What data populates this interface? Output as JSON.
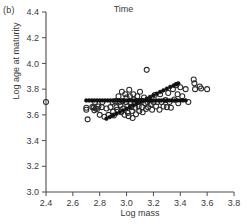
{
  "panel": {
    "label": "(b)"
  },
  "chart_data": {
    "type": "scatter",
    "title": "Time",
    "xlabel": "Log mass",
    "ylabel": "Log age at maturity",
    "xlim": [
      2.4,
      3.8
    ],
    "ylim": [
      3.0,
      4.4
    ],
    "xticks": [
      "2.4",
      "2.6",
      "2.8",
      "3.0",
      "3.2",
      "3.4",
      "3.6",
      "3.8"
    ],
    "yticks": [
      "3.0",
      "3.2",
      "3.4",
      "3.6",
      "3.8",
      "4.0",
      "4.2",
      "4.4"
    ],
    "grid": false,
    "legend": "none",
    "series": [
      {
        "name": "observed",
        "marker": "open-circle",
        "color": "#2b2b2b",
        "points": [
          [
            2.4,
            3.7
          ],
          [
            2.7,
            3.655
          ],
          [
            2.7,
            3.64
          ],
          [
            2.71,
            3.565
          ],
          [
            2.745,
            3.66
          ],
          [
            2.755,
            3.655
          ],
          [
            2.76,
            3.635
          ],
          [
            2.765,
            3.7
          ],
          [
            2.77,
            3.65
          ],
          [
            2.78,
            3.645
          ],
          [
            2.79,
            3.665
          ],
          [
            2.8,
            3.6
          ],
          [
            2.815,
            3.66
          ],
          [
            2.82,
            3.7
          ],
          [
            2.835,
            3.585
          ],
          [
            2.85,
            3.65
          ],
          [
            2.865,
            3.6
          ],
          [
            2.88,
            3.66
          ],
          [
            2.895,
            3.7
          ],
          [
            2.9,
            3.625
          ],
          [
            2.905,
            3.595
          ],
          [
            2.915,
            3.705
          ],
          [
            2.925,
            3.66
          ],
          [
            2.93,
            3.64
          ],
          [
            2.94,
            3.745
          ],
          [
            2.95,
            3.7
          ],
          [
            2.955,
            3.675
          ],
          [
            2.96,
            3.62
          ],
          [
            2.965,
            3.78
          ],
          [
            2.97,
            3.705
          ],
          [
            2.975,
            3.65
          ],
          [
            2.985,
            3.6
          ],
          [
            2.99,
            3.76
          ],
          [
            2.995,
            3.7
          ],
          [
            3.0,
            3.735
          ],
          [
            3.005,
            3.665
          ],
          [
            3.01,
            3.615
          ],
          [
            3.015,
            3.59
          ],
          [
            3.02,
            3.795
          ],
          [
            3.025,
            3.745
          ],
          [
            3.03,
            3.7
          ],
          [
            3.035,
            3.66
          ],
          [
            3.04,
            3.63
          ],
          [
            3.045,
            3.575
          ],
          [
            3.05,
            3.76
          ],
          [
            3.055,
            3.72
          ],
          [
            3.06,
            3.69
          ],
          [
            3.065,
            3.655
          ],
          [
            3.07,
            3.605
          ],
          [
            3.08,
            3.745
          ],
          [
            3.085,
            3.7
          ],
          [
            3.09,
            3.665
          ],
          [
            3.095,
            3.63
          ],
          [
            3.1,
            3.78
          ],
          [
            3.11,
            3.71
          ],
          [
            3.115,
            3.66
          ],
          [
            3.12,
            3.62
          ],
          [
            3.13,
            3.735
          ],
          [
            3.14,
            3.69
          ],
          [
            3.145,
            3.645
          ],
          [
            3.15,
            3.95
          ],
          [
            3.155,
            3.7
          ],
          [
            3.16,
            3.66
          ],
          [
            3.17,
            3.72
          ],
          [
            3.18,
            3.68
          ],
          [
            3.19,
            3.64
          ],
          [
            3.2,
            3.7
          ],
          [
            3.21,
            3.755
          ],
          [
            3.22,
            3.665
          ],
          [
            3.23,
            3.7
          ],
          [
            3.245,
            3.64
          ],
          [
            3.25,
            3.76
          ],
          [
            3.26,
            3.7
          ],
          [
            3.275,
            3.665
          ],
          [
            3.29,
            3.715
          ],
          [
            3.3,
            3.66
          ],
          [
            3.31,
            3.77
          ],
          [
            3.32,
            3.7
          ],
          [
            3.33,
            3.655
          ],
          [
            3.345,
            3.8
          ],
          [
            3.355,
            3.72
          ],
          [
            3.37,
            3.83
          ],
          [
            3.38,
            3.76
          ],
          [
            3.385,
            3.69
          ],
          [
            3.4,
            3.815
          ],
          [
            3.415,
            3.745
          ],
          [
            3.44,
            3.8
          ],
          [
            3.46,
            3.7
          ],
          [
            3.5,
            3.875
          ],
          [
            3.505,
            3.845
          ],
          [
            3.51,
            3.8
          ],
          [
            3.545,
            3.82
          ],
          [
            3.555,
            3.805
          ],
          [
            3.6,
            3.8
          ]
        ]
      },
      {
        "name": "flat-fitted",
        "marker": "filled-circle",
        "color": "#111111",
        "points": [
          [
            2.7,
            3.712
          ],
          [
            2.72,
            3.712
          ],
          [
            2.74,
            3.712
          ],
          [
            2.76,
            3.712
          ],
          [
            2.78,
            3.712
          ],
          [
            2.8,
            3.712
          ],
          [
            2.82,
            3.712
          ],
          [
            2.84,
            3.712
          ],
          [
            2.86,
            3.712
          ],
          [
            2.88,
            3.712
          ],
          [
            2.9,
            3.712
          ],
          [
            2.92,
            3.712
          ],
          [
            2.94,
            3.712
          ],
          [
            2.96,
            3.712
          ],
          [
            2.98,
            3.712
          ],
          [
            3.0,
            3.712
          ],
          [
            3.02,
            3.712
          ],
          [
            3.04,
            3.712
          ],
          [
            3.06,
            3.712
          ],
          [
            3.08,
            3.712
          ],
          [
            3.1,
            3.712
          ],
          [
            3.12,
            3.712
          ],
          [
            3.14,
            3.712
          ],
          [
            3.16,
            3.712
          ],
          [
            3.18,
            3.712
          ],
          [
            3.2,
            3.712
          ],
          [
            3.22,
            3.712
          ],
          [
            3.24,
            3.712
          ],
          [
            3.26,
            3.712
          ],
          [
            3.28,
            3.712
          ],
          [
            3.3,
            3.712
          ],
          [
            3.32,
            3.712
          ],
          [
            3.34,
            3.712
          ],
          [
            3.36,
            3.712
          ],
          [
            3.38,
            3.712
          ],
          [
            3.4,
            3.712
          ],
          [
            3.42,
            3.712
          ],
          [
            3.44,
            3.712
          ]
        ]
      },
      {
        "name": "rising-fitted",
        "marker": "filled-circle",
        "color": "#111111",
        "points": [
          [
            2.85,
            3.57
          ],
          [
            2.875,
            3.583
          ],
          [
            2.9,
            3.596
          ],
          [
            2.925,
            3.609
          ],
          [
            2.95,
            3.622
          ],
          [
            2.975,
            3.635
          ],
          [
            3.0,
            3.648
          ],
          [
            3.025,
            3.661
          ],
          [
            3.05,
            3.674
          ],
          [
            3.075,
            3.687
          ],
          [
            3.1,
            3.7
          ],
          [
            3.125,
            3.713
          ],
          [
            3.15,
            3.726
          ],
          [
            3.175,
            3.739
          ],
          [
            3.2,
            3.752
          ],
          [
            3.225,
            3.765
          ],
          [
            3.25,
            3.778
          ],
          [
            3.275,
            3.791
          ],
          [
            3.3,
            3.804
          ],
          [
            3.325,
            3.817
          ],
          [
            3.35,
            3.828
          ],
          [
            3.37,
            3.838
          ],
          [
            3.385,
            3.845
          ]
        ]
      }
    ]
  }
}
